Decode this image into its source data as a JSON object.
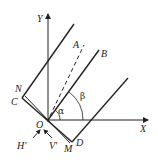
{
  "diagram": {
    "type": "geometry-coordinate-figure",
    "labels": {
      "y_axis": "Y",
      "x_axis": "X",
      "origin": "O",
      "point_a": "A",
      "point_b": "B",
      "point_n": "N",
      "point_c": "C",
      "point_m": "M",
      "point_d": "D",
      "h_prime": "H'",
      "v_prime": "V'",
      "alpha": "α",
      "beta": "β"
    },
    "colors": {
      "line": "#222222",
      "background": "#ffffff"
    }
  }
}
